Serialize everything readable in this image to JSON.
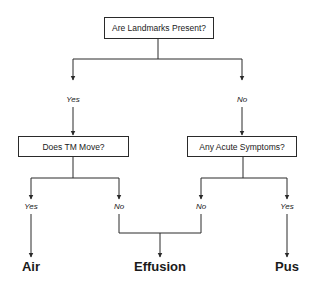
{
  "diagram": {
    "type": "decision-tree",
    "colors": {
      "line": "#2a2a2a",
      "text": "#1a1a1a",
      "background": "#ffffff"
    },
    "nodes": {
      "root": {
        "text": "Are Landmarks Present?"
      },
      "left": {
        "text": "Does TM Move?"
      },
      "right": {
        "text": "Any Acute Symptoms?"
      }
    },
    "edge_labels": {
      "root_yes": "Yes",
      "root_no": "No",
      "left_yes": "Yes",
      "left_no": "No",
      "right_no": "No",
      "right_yes": "Yes"
    },
    "outcomes": {
      "air": "Air",
      "effusion": "Effusion",
      "pus": "Pus"
    }
  }
}
